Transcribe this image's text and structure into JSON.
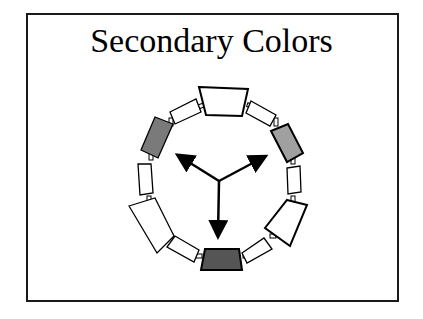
{
  "slide": {
    "title": "Secondary Colors"
  },
  "diagram": {
    "type": "color-wheel",
    "segments": 12,
    "highlighted_segments": [
      {
        "position": "upper-left",
        "fill": "#7a7a7a"
      },
      {
        "position": "upper-right",
        "fill": "#a0a0a0"
      },
      {
        "position": "bottom",
        "fill": "#555555"
      }
    ],
    "arrows": [
      "upper-left",
      "upper-right",
      "down"
    ],
    "colors": {
      "outline": "#000000",
      "unfilled": "#ffffff",
      "frame": "#1a1a1a"
    }
  }
}
